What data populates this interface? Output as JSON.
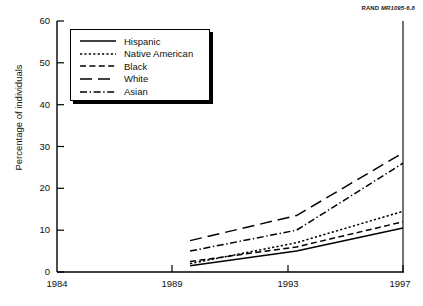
{
  "credit": {
    "brand": "RAND",
    "id": "MR1095-6.8"
  },
  "axes": {
    "ylabel": "Percentage of individuals",
    "xlabel": "",
    "y_ticks": [
      "0",
      "10",
      "20",
      "30",
      "40",
      "50",
      "60"
    ],
    "x_ticks": [
      "1984",
      "1989",
      "1993",
      "1997"
    ]
  },
  "legend": {
    "items": [
      {
        "label": "Hispanic",
        "style": "solid"
      },
      {
        "label": "Native American",
        "style": "dotted"
      },
      {
        "label": "Black",
        "style": "dashed"
      },
      {
        "label": "White",
        "style": "long-dash"
      },
      {
        "label": "Asian",
        "style": "dash-dot"
      }
    ]
  },
  "chart_data": {
    "type": "line",
    "title": "",
    "xlabel": "",
    "ylabel": "Percentage of individuals",
    "xlim": [
      1984,
      1997
    ],
    "ylim": [
      0,
      60
    ],
    "xticks": [
      1984,
      1989,
      1993,
      1997
    ],
    "yticks": [
      0,
      10,
      20,
      30,
      40,
      50,
      60
    ],
    "grid": false,
    "legend_position": "upper-left",
    "x": [
      1989,
      1993,
      1997
    ],
    "series": [
      {
        "name": "Hispanic",
        "style": "solid",
        "values": [
          1.5,
          5.0,
          10.5
        ]
      },
      {
        "name": "Native American",
        "style": "dotted",
        "values": [
          2.0,
          7.0,
          14.5
        ]
      },
      {
        "name": "Black",
        "style": "dashed",
        "values": [
          2.5,
          6.0,
          12.0
        ]
      },
      {
        "name": "White",
        "style": "long-dash",
        "values": [
          7.5,
          13.5,
          28.5
        ]
      },
      {
        "name": "Asian",
        "style": "dash-dot",
        "values": [
          5.0,
          10.0,
          26.0
        ]
      }
    ],
    "annotation": "RAND MR1095-6.8"
  }
}
